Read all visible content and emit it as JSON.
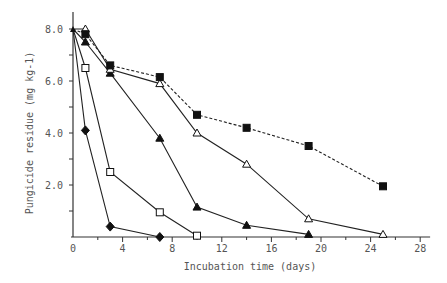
{
  "chart_data": {
    "type": "line",
    "title": "",
    "xlabel": "Incubation time (days)",
    "ylabel": "Pungicide residue (mg kg-1)",
    "xlim": [
      0,
      28
    ],
    "ylim": [
      0,
      8.0
    ],
    "x_ticks": [
      "0",
      "4",
      "8",
      "12",
      "16",
      "20",
      "24",
      "28"
    ],
    "y_ticks": [
      "2.0",
      "4.0",
      "6.0",
      "8.0"
    ],
    "grid": false,
    "legend": null,
    "series": [
      {
        "name": "filled diamond",
        "marker": "filled-diamond",
        "dash": false,
        "x": [
          0,
          1,
          3,
          7
        ],
        "y": [
          8.0,
          4.1,
          0.4,
          0.0
        ]
      },
      {
        "name": "open square",
        "marker": "open-square",
        "dash": false,
        "x": [
          0,
          1,
          3,
          7,
          10
        ],
        "y": [
          8.0,
          6.5,
          2.5,
          0.95,
          0.05
        ]
      },
      {
        "name": "filled triangle",
        "marker": "filled-triangle",
        "dash": false,
        "x": [
          0,
          1,
          3,
          7,
          10,
          14,
          19
        ],
        "y": [
          8.0,
          7.5,
          6.3,
          3.8,
          1.15,
          0.45,
          0.1
        ]
      },
      {
        "name": "open triangle",
        "marker": "open-triangle",
        "dash": false,
        "x": [
          0,
          1,
          3,
          7,
          10,
          14,
          19,
          25
        ],
        "y": [
          8.0,
          8.0,
          6.45,
          5.9,
          4.0,
          2.8,
          0.7,
          0.1
        ]
      },
      {
        "name": "filled square",
        "marker": "filled-square",
        "dash": true,
        "x": [
          0,
          1,
          3,
          7,
          10,
          14,
          19,
          25
        ],
        "y": [
          8.0,
          7.8,
          6.6,
          6.15,
          4.7,
          4.2,
          3.5,
          1.95
        ]
      }
    ]
  }
}
